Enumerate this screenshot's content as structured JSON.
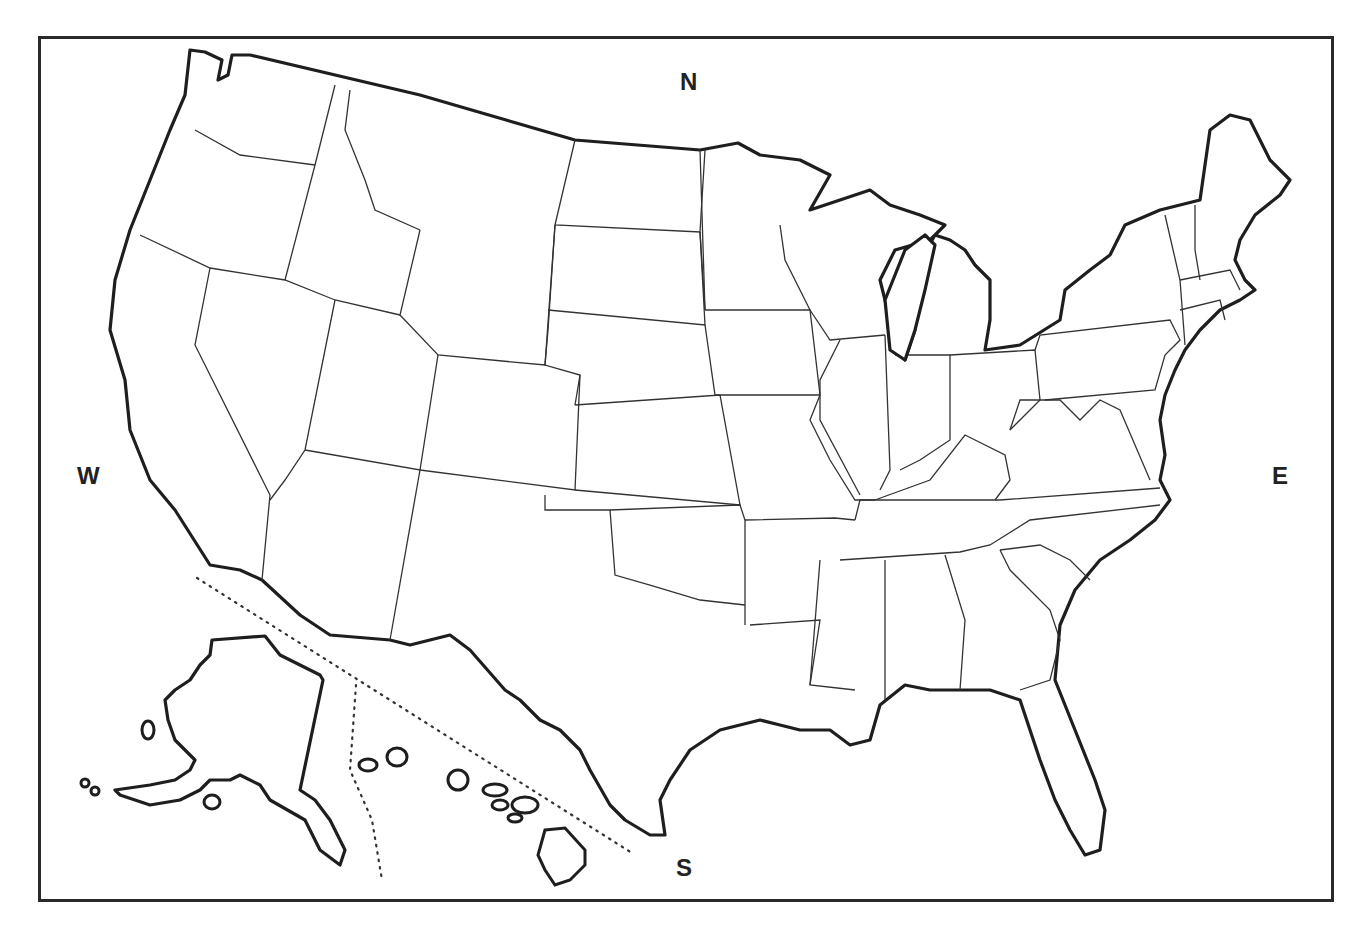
{
  "map": {
    "title": "Blank outline map of the United States",
    "compass": {
      "north": "N",
      "south": "S",
      "east": "E",
      "west": "W"
    },
    "insets": [
      "Alaska",
      "Hawaii"
    ],
    "colors": {
      "outline": "#1e1e1e",
      "border": "#333333",
      "fill": "#ffffff",
      "frame": "#2a2a2a"
    }
  }
}
